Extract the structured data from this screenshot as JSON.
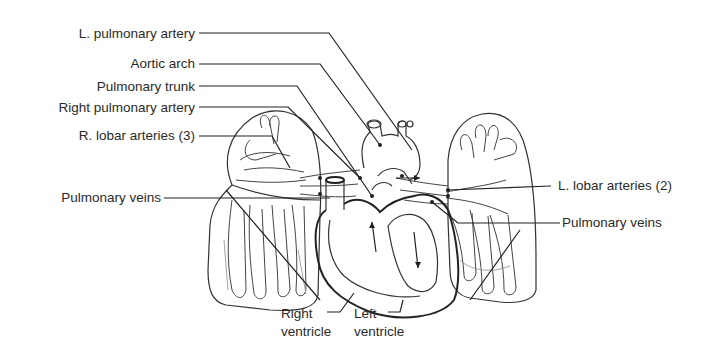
{
  "diagram": {
    "labels_left": [
      {
        "id": "l-pulmonary-artery",
        "text": "L. pulmonary artery"
      },
      {
        "id": "aortic-arch",
        "text": "Aortic arch"
      },
      {
        "id": "pulmonary-trunk",
        "text": "Pulmonary trunk"
      },
      {
        "id": "right-pulmonary-artery",
        "text": "Right pulmonary artery"
      },
      {
        "id": "r-lobar-arteries",
        "text": "R. lobar arteries (3)"
      },
      {
        "id": "pulmonary-veins-left",
        "text": "Pulmonary veins"
      }
    ],
    "labels_right": [
      {
        "id": "l-lobar-arteries",
        "text": "L. lobar arteries (2)"
      },
      {
        "id": "pulmonary-veins-right",
        "text": "Pulmonary veins"
      }
    ],
    "labels_bottom": [
      {
        "id": "right-ventricle",
        "line1": "Right",
        "line2": "ventricle"
      },
      {
        "id": "left-ventricle",
        "line1": "Left",
        "line2": "ventricle"
      }
    ],
    "colors": {
      "line": "#222222",
      "text": "#2a2a2a",
      "background": "#ffffff"
    }
  }
}
